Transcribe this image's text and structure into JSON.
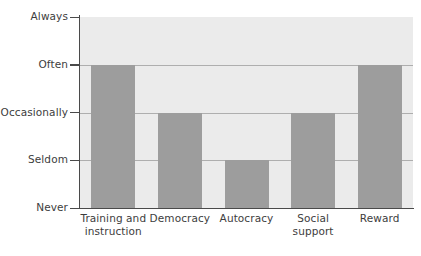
{
  "chart_data": {
    "type": "bar",
    "title": "",
    "subtitle": "",
    "xlabel": "",
    "ylabel": "",
    "orientation": "vertical",
    "grid": true,
    "legend": false,
    "legend_position": "none",
    "scale_type": "ordinal",
    "categories": [
      "Training and instruction",
      "Democracy",
      "Autocracy",
      "Social support",
      "Reward"
    ],
    "category_lines": [
      [
        "Training and",
        "instruction"
      ],
      [
        "Democracy"
      ],
      [
        "Autocracy"
      ],
      [
        "Social",
        "support"
      ],
      [
        "Reward"
      ]
    ],
    "ytick_labels": [
      "Never",
      "Seldom",
      "Occasionally",
      "Often",
      "Always"
    ],
    "ytick_values": [
      0,
      1,
      2,
      3,
      4
    ],
    "ylim": [
      0,
      4
    ],
    "values": [
      3,
      2,
      1,
      2,
      3
    ],
    "value_labels": [
      "Often",
      "Occasionally",
      "Seldom",
      "Occasionally",
      "Often"
    ],
    "colors": {
      "bar": "#9d9d9d",
      "plot_background": "#ebebeb",
      "gridline": "#8d8d8d",
      "axis": "#4a4a4a",
      "text": "#3d3d3d",
      "figure_background": "#ffffff"
    }
  }
}
